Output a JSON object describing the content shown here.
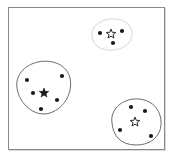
{
  "figure": {
    "title": "",
    "frame": {
      "x": 8,
      "y": 7,
      "width": 157,
      "height": 143,
      "border_color": "#888888",
      "background_color": "#ffffff",
      "shadow_color": "#d9d9d9"
    },
    "point_color": "#1a1a1a",
    "point_radius": 2.1,
    "star_filled_color": "#1a1a1a",
    "star_outline_color": "#2b2b2b"
  },
  "chart_data": {
    "type": "scatter",
    "title": "",
    "xlabel": "",
    "ylabel": "",
    "xlim": [
      0,
      176
    ],
    "ylim": [
      0,
      162
    ],
    "grid": false,
    "legend": "none",
    "annotations": [
      "Three clusters of points, each enclosed by a hand-drawn boundary, each with a star marking its centroid."
    ],
    "series": [
      {
        "name": "cluster-top",
        "label": "Top cluster",
        "outline_color": "#d0d0d0",
        "outline_path": "M 92,36 C 91,27 99,20 110,19 C 122,18 131,23 132,32 C 133,41 126,49 113,50 C 100,51 93,45 92,36 Z",
        "centroid": {
          "x": 111,
          "y": 34,
          "style": "outline",
          "label": "centroid-top"
        },
        "points": [
          {
            "x": 100,
            "y": 33
          },
          {
            "x": 122,
            "y": 31
          },
          {
            "x": 113,
            "y": 43
          }
        ],
        "point_count": 3
      },
      {
        "name": "cluster-left",
        "label": "Left cluster",
        "outline_color": "#5a5a5a",
        "outline_path": "M 17,88 C 15,76 24,65 38,62 C 53,59 67,65 70,78 C 73,92 65,108 50,113 C 34,118 19,103 17,88 Z",
        "centroid": {
          "x": 44,
          "y": 93,
          "style": "filled",
          "label": "centroid-left"
        },
        "points": [
          {
            "x": 27,
            "y": 80
          },
          {
            "x": 33,
            "y": 93
          },
          {
            "x": 62,
            "y": 76
          },
          {
            "x": 57,
            "y": 100
          },
          {
            "x": 41,
            "y": 109
          }
        ],
        "point_count": 5
      },
      {
        "name": "cluster-bottom-right",
        "label": "Bottom-right cluster",
        "outline_color": "#5a5a5a",
        "outline_path": "M 112,123 C 110,110 121,100 134,99 C 149,98 160,107 161,121 C 162,135 152,145 136,145 C 121,145 113,136 112,123 Z",
        "centroid": {
          "x": 135,
          "y": 122,
          "style": "outline",
          "label": "centroid-bottom-right"
        },
        "points": [
          {
            "x": 131,
            "y": 107
          },
          {
            "x": 145,
            "y": 111
          },
          {
            "x": 120,
            "y": 130
          },
          {
            "x": 151,
            "y": 136
          }
        ],
        "point_count": 4
      }
    ]
  }
}
